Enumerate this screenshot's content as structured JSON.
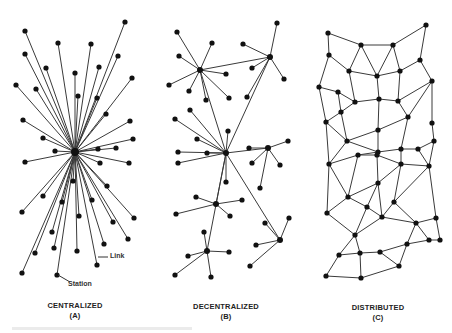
{
  "diagrams": [
    {
      "id": "centralized",
      "title": "CENTRALIZED",
      "sub": "(A)",
      "annotations": {
        "link": "Link",
        "station": "Station"
      },
      "hub": [
        75,
        152
      ],
      "nodes": [
        [
          25,
          31
        ],
        [
          125,
          22
        ],
        [
          58,
          43
        ],
        [
          91,
          44
        ],
        [
          25,
          54
        ],
        [
          46,
          68
        ],
        [
          75,
          73
        ],
        [
          99,
          67
        ],
        [
          118,
          56
        ],
        [
          132,
          78
        ],
        [
          16,
          85
        ],
        [
          36,
          89
        ],
        [
          78,
          96
        ],
        [
          97,
          98
        ],
        [
          106,
          114
        ],
        [
          23,
          120
        ],
        [
          130,
          121
        ],
        [
          43,
          138
        ],
        [
          133,
          139
        ],
        [
          55,
          151
        ],
        [
          98,
          149
        ],
        [
          116,
          148
        ],
        [
          25,
          162
        ],
        [
          100,
          163
        ],
        [
          129,
          163
        ],
        [
          73,
          181
        ],
        [
          107,
          186
        ],
        [
          43,
          196
        ],
        [
          62,
          202
        ],
        [
          22,
          212
        ],
        [
          92,
          200
        ],
        [
          79,
          216
        ],
        [
          113,
          222
        ],
        [
          134,
          218
        ],
        [
          52,
          232
        ],
        [
          128,
          239
        ],
        [
          104,
          244
        ],
        [
          35,
          253
        ],
        [
          54,
          248
        ],
        [
          77,
          251
        ],
        [
          97,
          265
        ],
        [
          22,
          273
        ],
        [
          57,
          275
        ]
      ]
    },
    {
      "id": "decentralized",
      "title": "DECENTRALIZED",
      "sub": "(B)",
      "hubs": [
        [
          200,
          70
        ],
        [
          270,
          57
        ],
        [
          226,
          153
        ],
        [
          216,
          204
        ],
        [
          207,
          251
        ],
        [
          280,
          240
        ],
        [
          268,
          148
        ]
      ],
      "hub_links": [
        [
          0,
          1
        ],
        [
          0,
          2
        ],
        [
          1,
          2
        ],
        [
          2,
          3
        ],
        [
          2,
          4
        ],
        [
          2,
          5
        ],
        [
          2,
          6
        ]
      ],
      "leaves": [
        [
          0,
          [
            177,
            32
          ]
        ],
        [
          0,
          [
            212,
            43
          ]
        ],
        [
          0,
          [
            179,
            56
          ]
        ],
        [
          0,
          [
            169,
            85
          ]
        ],
        [
          0,
          [
            189,
            91
          ]
        ],
        [
          0,
          [
            206,
            100
          ]
        ],
        [
          0,
          [
            226,
            74
          ]
        ],
        [
          0,
          [
            229,
            98
          ]
        ],
        [
          1,
          [
            277,
            23
          ]
        ],
        [
          1,
          [
            243,
            44
          ]
        ],
        [
          1,
          [
            252,
            68
          ]
        ],
        [
          1,
          [
            284,
            79
          ]
        ],
        [
          1,
          [
            247,
            97
          ]
        ],
        [
          2,
          [
            190,
            110
          ]
        ],
        [
          2,
          [
            175,
            119
          ]
        ],
        [
          2,
          [
            228,
            131
          ]
        ],
        [
          2,
          [
            197,
            139
          ]
        ],
        [
          2,
          [
            178,
            152
          ]
        ],
        [
          2,
          [
            207,
            153
          ]
        ],
        [
          2,
          [
            178,
            163
          ]
        ],
        [
          2,
          [
            226,
            182
          ]
        ],
        [
          3,
          [
            196,
            197
          ]
        ],
        [
          3,
          [
            242,
            200
          ]
        ],
        [
          3,
          [
            176,
            214
          ]
        ],
        [
          3,
          [
            230,
            216
          ]
        ],
        [
          4,
          [
            204,
            232
          ]
        ],
        [
          4,
          [
            229,
            252
          ]
        ],
        [
          4,
          [
            188,
            256
          ]
        ],
        [
          4,
          [
            175,
            275
          ]
        ],
        [
          4,
          [
            211,
            277
          ]
        ],
        [
          5,
          [
            289,
            218
          ]
        ],
        [
          5,
          [
            265,
            223
          ]
        ],
        [
          5,
          [
            256,
            245
          ]
        ],
        [
          5,
          [
            250,
            266
          ]
        ],
        [
          6,
          [
            249,
            148
          ]
        ],
        [
          6,
          [
            288,
            141
          ]
        ],
        [
          6,
          [
            252,
            163
          ]
        ],
        [
          6,
          [
            280,
            165
          ]
        ],
        [
          6,
          [
            260,
            188
          ]
        ]
      ]
    },
    {
      "id": "distributed",
      "title": "DISTRIBUTED",
      "sub": "(C)",
      "nodes": [
        [
          328,
          33
        ],
        [
          426,
          25
        ],
        [
          361,
          45
        ],
        [
          393,
          45
        ],
        [
          329,
          55
        ],
        [
          349,
          71
        ],
        [
          377,
          76
        ],
        [
          400,
          71
        ],
        [
          420,
          60
        ],
        [
          319,
          87
        ],
        [
          338,
          92
        ],
        [
          355,
          102
        ],
        [
          379,
          99
        ],
        [
          398,
          101
        ],
        [
          432,
          81
        ],
        [
          341,
          112
        ],
        [
          408,
          117
        ],
        [
          326,
          122
        ],
        [
          378,
          130
        ],
        [
          432,
          123
        ],
        [
          347,
          141
        ],
        [
          378,
          152
        ],
        [
          401,
          149
        ],
        [
          418,
          149
        ],
        [
          434,
          141
        ],
        [
          329,
          164
        ],
        [
          358,
          155
        ],
        [
          377,
          155
        ],
        [
          401,
          164
        ],
        [
          429,
          166
        ],
        [
          378,
          183
        ],
        [
          348,
          197
        ],
        [
          394,
          202
        ],
        [
          327,
          213
        ],
        [
          367,
          207
        ],
        [
          382,
          217
        ],
        [
          416,
          223
        ],
        [
          436,
          218
        ],
        [
          355,
          235
        ],
        [
          440,
          240
        ],
        [
          407,
          244
        ],
        [
          429,
          240
        ],
        [
          339,
          255
        ],
        [
          360,
          253
        ],
        [
          380,
          252
        ],
        [
          399,
          266
        ],
        [
          326,
          276
        ],
        [
          361,
          278
        ]
      ],
      "edges": [
        [
          0,
          2
        ],
        [
          2,
          3
        ],
        [
          3,
          1
        ],
        [
          0,
          4
        ],
        [
          1,
          8
        ],
        [
          2,
          5
        ],
        [
          2,
          6
        ],
        [
          3,
          6
        ],
        [
          3,
          7
        ],
        [
          4,
          5
        ],
        [
          4,
          9
        ],
        [
          5,
          6
        ],
        [
          6,
          7
        ],
        [
          7,
          8
        ],
        [
          8,
          14
        ],
        [
          9,
          10
        ],
        [
          5,
          11
        ],
        [
          10,
          11
        ],
        [
          6,
          12
        ],
        [
          7,
          13
        ],
        [
          11,
          12
        ],
        [
          12,
          13
        ],
        [
          13,
          14
        ],
        [
          9,
          17
        ],
        [
          10,
          15
        ],
        [
          11,
          15
        ],
        [
          15,
          17
        ],
        [
          12,
          18
        ],
        [
          13,
          16
        ],
        [
          14,
          16
        ],
        [
          16,
          18
        ],
        [
          14,
          19
        ],
        [
          15,
          20
        ],
        [
          17,
          20
        ],
        [
          18,
          20
        ],
        [
          18,
          21
        ],
        [
          16,
          22
        ],
        [
          19,
          24
        ],
        [
          20,
          21
        ],
        [
          21,
          22
        ],
        [
          22,
          23
        ],
        [
          23,
          24
        ],
        [
          17,
          25
        ],
        [
          20,
          25
        ],
        [
          21,
          26
        ],
        [
          21,
          27
        ],
        [
          22,
          28
        ],
        [
          23,
          29
        ],
        [
          25,
          26
        ],
        [
          26,
          27
        ],
        [
          27,
          28
        ],
        [
          28,
          29
        ],
        [
          24,
          29
        ],
        [
          25,
          31
        ],
        [
          26,
          31
        ],
        [
          27,
          30
        ],
        [
          28,
          30
        ],
        [
          31,
          30
        ],
        [
          28,
          32
        ],
        [
          29,
          32
        ],
        [
          29,
          37
        ],
        [
          25,
          33
        ],
        [
          31,
          33
        ],
        [
          31,
          34
        ],
        [
          30,
          34
        ],
        [
          30,
          35
        ],
        [
          34,
          35
        ],
        [
          32,
          35
        ],
        [
          32,
          36
        ],
        [
          35,
          36
        ],
        [
          36,
          37
        ],
        [
          33,
          38
        ],
        [
          34,
          38
        ],
        [
          35,
          38
        ],
        [
          36,
          41
        ],
        [
          37,
          39
        ],
        [
          39,
          41
        ],
        [
          36,
          40
        ],
        [
          41,
          40
        ],
        [
          38,
          42
        ],
        [
          38,
          43
        ],
        [
          42,
          43
        ],
        [
          43,
          44
        ],
        [
          44,
          40
        ],
        [
          44,
          45
        ],
        [
          40,
          45
        ],
        [
          42,
          46
        ],
        [
          43,
          47
        ],
        [
          46,
          47
        ],
        [
          47,
          45
        ]
      ]
    }
  ],
  "annotation_positions": {
    "link_label": [
      102,
      253
    ],
    "link_pointer": [
      [
        98,
        257
      ],
      [
        108,
        257
      ]
    ],
    "station_label": [
      70,
      280
    ],
    "station_pointer": [
      [
        58,
        275
      ],
      [
        70,
        282
      ]
    ]
  },
  "caption_strip_visible": true
}
